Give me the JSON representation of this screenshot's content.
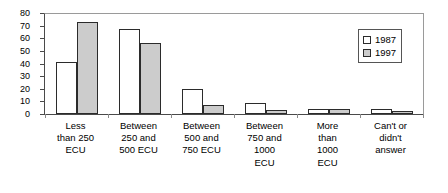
{
  "chart_data": {
    "type": "bar",
    "title": "",
    "subtitle": "",
    "xlabel": "",
    "ylabel": "",
    "ylim": [
      0,
      80
    ],
    "y_ticks": [
      0,
      10,
      20,
      30,
      40,
      50,
      60,
      70,
      80
    ],
    "grid": false,
    "legend_position": "top-right",
    "categories": [
      "Less than 250 ECU",
      "Between 250 and 500 ECU",
      "Between 500 and 750 ECU",
      "Between 750 and 1000 ECU",
      "More than 1000 ECU",
      "Can't or didn't answer"
    ],
    "category_lines": [
      [
        "Less",
        "than 250",
        "ECU"
      ],
      [
        "Between",
        "250 and",
        "500 ECU"
      ],
      [
        "Between",
        "500 and",
        "750 ECU"
      ],
      [
        "Between",
        "750 and",
        "1000",
        "ECU"
      ],
      [
        "More",
        "than",
        "1000",
        "ECU"
      ],
      [
        "Can't or",
        "didn't",
        "answer"
      ]
    ],
    "series": [
      {
        "name": "1987",
        "color": "#ffffff",
        "values": [
          41,
          67,
          20,
          9,
          4,
          4
        ]
      },
      {
        "name": "1997",
        "color": "#cccccc",
        "values": [
          73,
          56,
          7,
          3,
          4,
          2
        ]
      }
    ]
  },
  "legend": {
    "entries": [
      {
        "label": "1987",
        "swatch": "white-square-swatch"
      },
      {
        "label": "1997",
        "swatch": "gray-square-swatch"
      }
    ]
  },
  "axis": {
    "y_tick_labels": [
      "80",
      "70",
      "60",
      "50",
      "40",
      "30",
      "20",
      "10",
      "0"
    ]
  }
}
